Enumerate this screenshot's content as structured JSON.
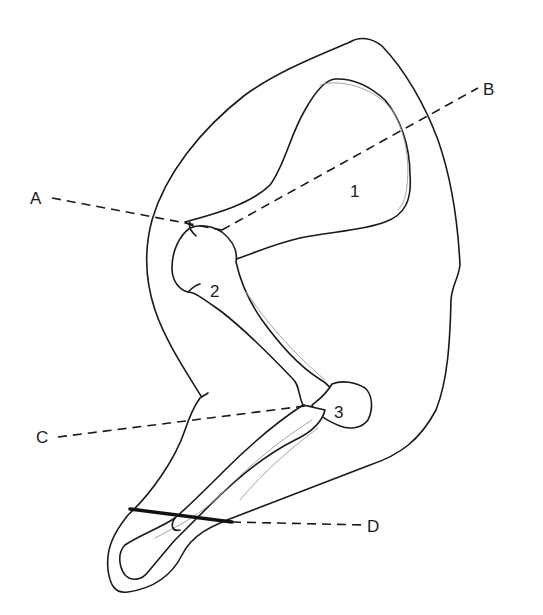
{
  "diagram": {
    "labels": {
      "A": "A",
      "B": "B",
      "C": "C",
      "D": "D"
    },
    "numbers": {
      "one": "1",
      "two": "2",
      "three": "3"
    },
    "colors": {
      "line": "#1a1a1a",
      "detail": "#9a9a9a",
      "background": "#ffffff"
    }
  }
}
